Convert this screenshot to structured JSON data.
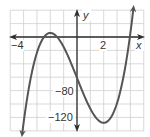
{
  "chart_data": {
    "type": "line",
    "title": "",
    "xlabel": "x",
    "ylabel": "y",
    "xlim": [
      -5,
      5
    ],
    "ylim": [
      -140,
      40
    ],
    "grid": true,
    "x_grid_step": 1,
    "y_grid_step": 20,
    "x_tick_labels": [
      {
        "value": -4,
        "label": "−4"
      },
      {
        "value": 2,
        "label": "2"
      }
    ],
    "y_tick_labels": [
      {
        "value": -80,
        "label": "−80"
      },
      {
        "value": -120,
        "label": "−120"
      }
    ],
    "series": [
      {
        "name": "cubic curve",
        "description": "cubic with local max near (-2, 6) and local min near (2, -128); y-intercept about -61; arrows at both ends",
        "key_points": [
          {
            "x": -4.1,
            "y": -144,
            "note": "arrow end (down)"
          },
          {
            "x": -3.3,
            "y": -20
          },
          {
            "x": -2,
            "y": 6,
            "note": "local max"
          },
          {
            "x": 0,
            "y": -61,
            "note": "y-intercept"
          },
          {
            "x": 2,
            "y": -128,
            "note": "local min"
          },
          {
            "x": 3.8,
            "y": 0
          },
          {
            "x": 4.25,
            "y": 47,
            "note": "arrow end (up)"
          }
        ],
        "coef": {
          "a": 4.19,
          "c": -50.28,
          "d": -61
        },
        "x_range": [
          -4.1,
          4.22
        ]
      }
    ],
    "colors": {
      "curve": "#555555",
      "axes": "#2e2e2e",
      "grid": "#cfcfcf"
    }
  },
  "labels": {
    "x_axis": "x",
    "y_axis": "y",
    "x_tick_neg4": "−4",
    "x_tick_2": "2",
    "y_tick_neg80": "−80",
    "y_tick_neg120": "−120"
  }
}
